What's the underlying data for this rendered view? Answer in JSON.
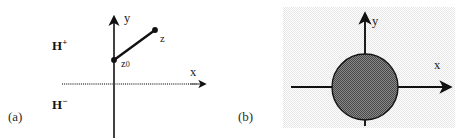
{
  "figure": {
    "width": 470,
    "height": 140,
    "background_color": "#ffffff"
  },
  "panels": [
    {
      "id": "a",
      "caption": "(a)",
      "axes": {
        "y_label": "y",
        "x_label": "x",
        "y_axis_style": "solid",
        "x_axis_style": "dotted",
        "origin": {
          "x": 114,
          "y": 84
        }
      },
      "labels": {
        "upper_half_plane": "H",
        "upper_half_plane_sign": "+",
        "lower_half_plane": "H",
        "lower_half_plane_sign": "−",
        "point_z": "z",
        "point_z0": "z",
        "point_z0_sub": "0"
      },
      "segment": {
        "from": {
          "x": 114,
          "y": 60
        },
        "to": {
          "x": 155,
          "y": 30
        },
        "color": "#111111"
      }
    },
    {
      "id": "b",
      "caption": "(b)",
      "background_color": "#f0f0f0",
      "background_rect": {
        "x": 283,
        "y": 7,
        "width": 172,
        "height": 121
      },
      "axes": {
        "y_label": "y",
        "x_label": "x",
        "y_axis_style": "solid",
        "x_axis_style": "solid",
        "origin": {
          "x": 365,
          "y": 87
        }
      },
      "disk": {
        "center": {
          "x": 365,
          "y": 87
        },
        "radius": 33,
        "fill_color": "#6e6e6e",
        "stroke_color": "#111111"
      }
    }
  ],
  "colors": {
    "ink": "#111111",
    "panel_background": "#f0f0f0",
    "disk_fill": "#6e6e6e",
    "page_background": "#ffffff"
  }
}
